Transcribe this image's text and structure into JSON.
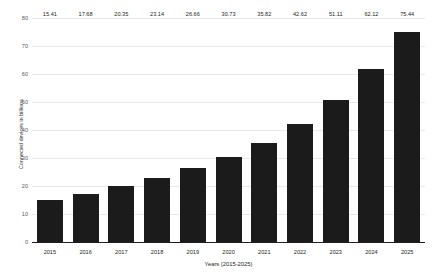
{
  "chart_data": {
    "type": "bar",
    "title": "",
    "xlabel": "Years (2015-2025)",
    "ylabel": "Connected devices in billions",
    "categories": [
      "2015",
      "2016",
      "2017",
      "2018",
      "2019",
      "2020",
      "2021",
      "2022",
      "2023",
      "2024",
      "2025"
    ],
    "values": [
      15.41,
      17.68,
      20.35,
      23.14,
      26.66,
      30.73,
      35.82,
      42.62,
      51.11,
      62.12,
      75.44
    ],
    "value_labels": [
      "15.41",
      "17.68",
      "20.35",
      "23.14",
      "26.66",
      "30.73",
      "35.82",
      "42.62",
      "51.11",
      "62.12",
      "75.44"
    ],
    "ylim": [
      0,
      80
    ],
    "yticks": [
      0,
      10,
      20,
      30,
      40,
      50,
      60,
      70,
      80
    ],
    "ytick_labels": [
      "0",
      "10",
      "20",
      "30",
      "40",
      "50",
      "60",
      "70",
      "80"
    ],
    "grid": true,
    "legend": false,
    "bar_color": "#1b1b1b",
    "grid_color": "#e9e9ea",
    "axis_color": "#231f20",
    "background": "#ffffff"
  }
}
